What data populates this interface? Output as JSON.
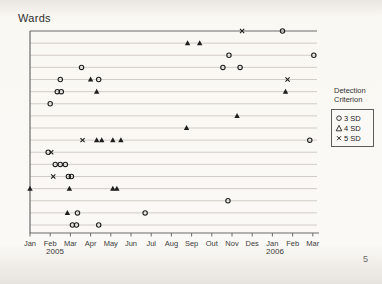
{
  "page": {
    "title": "Wards",
    "page_number": "5"
  },
  "axis": {
    "year_left": "2005",
    "year_right": "2006"
  },
  "legend": {
    "title_lines": [
      "Detection",
      "Criterion"
    ],
    "entries": [
      {
        "icon": "circle-marker-icon",
        "label": "3 SD"
      },
      {
        "icon": "triangle-marker-icon",
        "label": "4 SD"
      },
      {
        "icon": "x-marker-icon",
        "label": "5 SD"
      }
    ]
  },
  "chart_data": {
    "type": "scatter",
    "title": "Wards",
    "xlabel": "",
    "ylabel": "",
    "grid": true,
    "legend_position": "right",
    "x_axis": {
      "tick_labels": [
        "Jan",
        "Feb",
        "Mar",
        "Apr",
        "May",
        "Jun",
        "Jul",
        "Aug",
        "Sep",
        "Out",
        "Nov",
        "Des",
        "Jan",
        "Feb",
        "Mar"
      ],
      "years": [
        "2005",
        "2006"
      ],
      "range_months": [
        0,
        14
      ]
    },
    "y_axis": {
      "rows": 17
    },
    "marker_legend": [
      {
        "marker": "circle",
        "label": "3 SD"
      },
      {
        "marker": "triangle",
        "label": "4 SD"
      },
      {
        "marker": "x",
        "label": "5 SD"
      }
    ],
    "rows": [
      {
        "ward": 1,
        "markers": [
          {
            "criterion": "5 SD",
            "month": 10.5
          },
          {
            "criterion": "3 SD",
            "month": 12.5
          }
        ]
      },
      {
        "ward": 2,
        "markers": [
          {
            "criterion": "4 SD",
            "month": 7.8
          },
          {
            "criterion": "4 SD",
            "month": 8.4
          }
        ]
      },
      {
        "ward": 3,
        "markers": [
          {
            "criterion": "3 SD",
            "month": 9.85
          },
          {
            "criterion": "3 SD",
            "month": 14.05
          }
        ]
      },
      {
        "ward": 4,
        "markers": [
          {
            "criterion": "3 SD",
            "month": 2.55
          },
          {
            "criterion": "3 SD",
            "month": 9.55
          },
          {
            "criterion": "3 SD",
            "month": 10.4
          }
        ]
      },
      {
        "ward": 5,
        "markers": [
          {
            "criterion": "3 SD",
            "month": 1.5
          },
          {
            "criterion": "4 SD",
            "month": 3.0
          },
          {
            "criterion": "3 SD",
            "month": 3.4
          },
          {
            "criterion": "5 SD",
            "month": 12.75
          }
        ]
      },
      {
        "ward": 6,
        "markers": [
          {
            "criterion": "3 SD",
            "month": 1.35
          },
          {
            "criterion": "3 SD",
            "month": 1.55
          },
          {
            "criterion": "4 SD",
            "month": 3.3
          },
          {
            "criterion": "4 SD",
            "month": 12.65
          }
        ]
      },
      {
        "ward": 7,
        "markers": [
          {
            "criterion": "3 SD",
            "month": 1.0
          }
        ]
      },
      {
        "ward": 8,
        "markers": [
          {
            "criterion": "4 SD",
            "month": 10.25
          }
        ]
      },
      {
        "ward": 9,
        "markers": [
          {
            "criterion": "4 SD",
            "month": 7.75
          }
        ]
      },
      {
        "ward": 10,
        "markers": [
          {
            "criterion": "5 SD",
            "month": 2.6
          },
          {
            "criterion": "4 SD",
            "month": 3.3
          },
          {
            "criterion": "4 SD",
            "month": 3.55
          },
          {
            "criterion": "4 SD",
            "month": 4.1
          },
          {
            "criterion": "4 SD",
            "month": 4.5
          },
          {
            "criterion": "3 SD",
            "month": 13.85
          }
        ]
      },
      {
        "ward": 11,
        "markers": [
          {
            "criterion": "3 SD",
            "month": 0.9
          },
          {
            "criterion": "5 SD",
            "month": 1.05
          }
        ]
      },
      {
        "ward": 12,
        "markers": [
          {
            "criterion": "3 SD",
            "month": 1.25
          },
          {
            "criterion": "3 SD",
            "month": 1.5
          },
          {
            "criterion": "3 SD",
            "month": 1.75
          }
        ]
      },
      {
        "ward": 13,
        "markers": [
          {
            "criterion": "5 SD",
            "month": 1.15
          },
          {
            "criterion": "3 SD",
            "month": 1.9
          },
          {
            "criterion": "3 SD",
            "month": 2.05
          }
        ]
      },
      {
        "ward": 14,
        "markers": [
          {
            "criterion": "4 SD",
            "month": 0.0
          },
          {
            "criterion": "4 SD",
            "month": 1.95
          },
          {
            "criterion": "4 SD",
            "month": 4.1
          },
          {
            "criterion": "4 SD",
            "month": 4.3
          }
        ]
      },
      {
        "ward": 15,
        "markers": [
          {
            "criterion": "3 SD",
            "month": 9.8
          }
        ]
      },
      {
        "ward": 16,
        "markers": [
          {
            "criterion": "4 SD",
            "month": 1.85
          },
          {
            "criterion": "3 SD",
            "month": 2.35
          },
          {
            "criterion": "3 SD",
            "month": 5.7
          }
        ]
      },
      {
        "ward": 17,
        "markers": [
          {
            "criterion": "3 SD",
            "month": 2.1
          },
          {
            "criterion": "3 SD",
            "month": 2.3
          },
          {
            "criterion": "3 SD",
            "month": 3.4
          }
        ]
      }
    ],
    "colors": {
      "marker": "#1e1e1e",
      "gridline": "#c7c2ba",
      "axis": "#6b6b6b"
    }
  }
}
